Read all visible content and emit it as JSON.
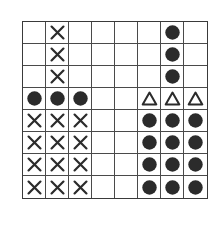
{
  "grid": {
    "rows": 8,
    "cols": 8,
    "colors": {
      "line": "#4a4a4a",
      "symbol": "#2b2b2b",
      "background": "#ffffff"
    },
    "legend_symbols": {
      "X": "cross",
      "O": "filled-circle",
      "T": "open-triangle",
      "": "empty"
    },
    "cells": [
      [
        "",
        "X",
        "",
        "",
        "",
        "",
        "O",
        ""
      ],
      [
        "",
        "X",
        "",
        "",
        "",
        "",
        "O",
        ""
      ],
      [
        "",
        "X",
        "",
        "",
        "",
        "",
        "O",
        ""
      ],
      [
        "O",
        "O",
        "O",
        "",
        "",
        "T",
        "T",
        "T"
      ],
      [
        "X",
        "X",
        "X",
        "",
        "",
        "O",
        "O",
        "O"
      ],
      [
        "X",
        "X",
        "X",
        "",
        "",
        "O",
        "O",
        "O"
      ],
      [
        "X",
        "X",
        "X",
        "",
        "",
        "O",
        "O",
        "O"
      ],
      [
        "X",
        "X",
        "X",
        "",
        "",
        "O",
        "O",
        "O"
      ]
    ]
  }
}
